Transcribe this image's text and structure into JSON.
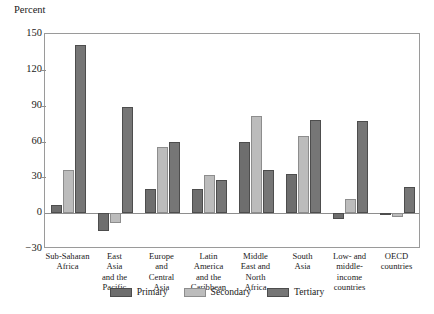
{
  "chart_data": {
    "type": "bar",
    "title": "",
    "xlabel": "",
    "ylabel": "Percent",
    "ylim": [
      -30,
      150
    ],
    "yticks": [
      -30,
      0,
      30,
      60,
      90,
      120,
      150
    ],
    "ytick_labels": [
      "−30",
      "0",
      "30",
      "60",
      "90",
      "120",
      "150"
    ],
    "grid": false,
    "legend_position": "bottom",
    "categories": [
      "Sub-Saharan Africa",
      "East Asia and the Pacific",
      "Europe and Central Asia",
      "Latin America and the Caribbean",
      "Middle East and North Africa",
      "South Asia",
      "Low- and middle-income countries",
      "OECD countries"
    ],
    "category_lines": [
      [
        "Sub-Saharan",
        "Africa"
      ],
      [
        "East",
        "Asia",
        "and the",
        "Pacific"
      ],
      [
        "Europe",
        "and",
        "Central",
        "Asia"
      ],
      [
        "Latin",
        "America",
        "and the",
        "Caribbean"
      ],
      [
        "Middle",
        "East and",
        "North",
        "Africa"
      ],
      [
        "South",
        "Asia"
      ],
      [
        "Low- and",
        "middle-",
        "income",
        "countries"
      ],
      [
        "OECD",
        "countries"
      ]
    ],
    "series": [
      {
        "name": "Primary",
        "color": "#6e6e6e",
        "values": [
          7,
          -15,
          20,
          20,
          60,
          33,
          -5,
          -1
        ]
      },
      {
        "name": "Secondary",
        "color": "#bcbcbc",
        "values": [
          36,
          -8,
          55,
          32,
          81,
          65,
          12,
          -3
        ]
      },
      {
        "name": "Tertiary",
        "color": "#767676",
        "values": [
          141,
          89,
          60,
          28,
          36,
          78,
          77,
          22
        ]
      }
    ]
  }
}
